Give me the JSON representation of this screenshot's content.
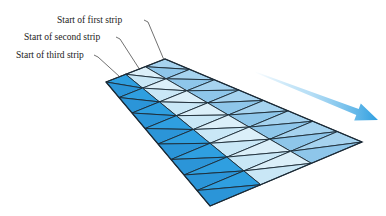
{
  "figure": {
    "labels": [
      {
        "text": "Start of first strip",
        "x": 57,
        "y": 20,
        "leader": [
          [
            144,
            20
          ],
          [
            148,
            22
          ],
          [
            164,
            60
          ]
        ]
      },
      {
        "text": "Start of second strip",
        "x": 24,
        "y": 37,
        "leader": [
          [
            116,
            37
          ],
          [
            120,
            39
          ],
          [
            140,
            70
          ]
        ]
      },
      {
        "text": "Start of third strip",
        "x": 16,
        "y": 55,
        "leader": [
          [
            94,
            55
          ],
          [
            98,
            57
          ],
          [
            120,
            77
          ]
        ]
      }
    ],
    "mesh": {
      "corners": {
        "near_start": [
          106,
          82
        ],
        "far_start": [
          165,
          59
        ],
        "far_end": [
          362,
          142
        ],
        "near_end": [
          210,
          206
        ]
      },
      "strips": 3,
      "columns": 4,
      "strip_colors": [
        "#a6d3ef",
        "#dbeff9",
        "#2f9fe0"
      ],
      "alt_colors": [
        "#8ec6ea",
        "#c9e7f6",
        "#2b95d8"
      ],
      "edge_color": "#1b2a36"
    },
    "arrow": {
      "from": [
        255,
        72
      ],
      "to": [
        378,
        120
      ],
      "color": "#3aa8e8"
    }
  }
}
